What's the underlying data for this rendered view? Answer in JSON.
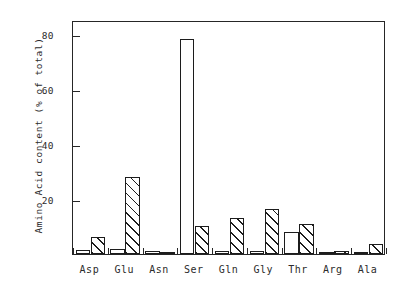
{
  "chart_data": {
    "type": "bar",
    "title": "",
    "xlabel": "",
    "ylabel": "Amino Acid content (% of total)",
    "ylim": [
      0,
      85
    ],
    "yticks": [
      20,
      40,
      60,
      80
    ],
    "ytick_labels": [
      "20",
      "40",
      "60",
      "80"
    ],
    "grid": false,
    "legend": "none",
    "categories": [
      "Asp",
      "Glu",
      "Asn",
      "Ser",
      "Gln",
      "Gly",
      "Thr",
      "Arg",
      "Ala"
    ],
    "series": [
      {
        "name": "open",
        "fill": "open",
        "values": [
          1.5,
          2.0,
          1.0,
          78.0,
          1.0,
          1.0,
          8.0,
          0.5,
          0.5
        ]
      },
      {
        "name": "hatched",
        "fill": "hatched",
        "values": [
          6.0,
          28.0,
          0.8,
          10.0,
          13.0,
          16.5,
          11.0,
          1.0,
          3.5
        ]
      }
    ]
  },
  "axis": {
    "y_title": "Amino Acid content (% of total)"
  }
}
